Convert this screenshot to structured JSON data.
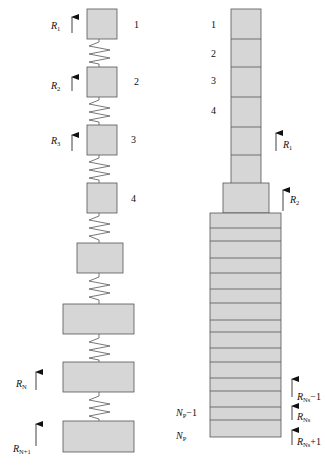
{
  "diagram": {
    "type": "mass-spring model comparison",
    "colors": {
      "box_fill": "#d6d6d6",
      "box_stroke": "#555555",
      "spring": "#555555",
      "arrow": "#111111"
    },
    "left_model": {
      "description": "Discrete masses connected by springs",
      "mass_labels": [
        "1",
        "2",
        "3",
        "4"
      ],
      "force_labels": [
        {
          "base": "R",
          "sub": "1"
        },
        {
          "base": "R",
          "sub": "2"
        },
        {
          "base": "R",
          "sub": "3"
        },
        {
          "base": "R",
          "sub": "N"
        },
        {
          "base": "R",
          "sub": "N+1"
        }
      ],
      "boxes": [
        {
          "x": 87,
          "y": 9,
          "w": 30,
          "h": 30
        },
        {
          "x": 87,
          "y": 67,
          "w": 30,
          "h": 30
        },
        {
          "x": 87,
          "y": 125,
          "w": 30,
          "h": 30
        },
        {
          "x": 87,
          "y": 183,
          "w": 30,
          "h": 30
        },
        {
          "x": 77,
          "y": 243,
          "w": 46,
          "h": 30
        },
        {
          "x": 63,
          "y": 304,
          "w": 71,
          "h": 30
        },
        {
          "x": 63,
          "y": 362,
          "w": 71,
          "h": 30
        },
        {
          "x": 63,
          "y": 421,
          "w": 71,
          "h": 31
        }
      ]
    },
    "right_model": {
      "description": "Stacked layered column",
      "layer_labels": [
        "1",
        "2",
        "3",
        "4"
      ],
      "bottom_labels": [
        {
          "base": "N",
          "sub": "P",
          "suffix": "−1"
        },
        {
          "base": "N",
          "sub": "P",
          "suffix": ""
        }
      ],
      "force_labels": [
        {
          "base": "R",
          "sub": "1",
          "suffix": ""
        },
        {
          "base": "R",
          "sub": "2",
          "suffix": ""
        },
        {
          "base": "R",
          "sub": "Ns",
          "suffix": "−1"
        },
        {
          "base": "R",
          "sub": "Ns",
          "suffix": ""
        },
        {
          "base": "R",
          "sub": "Ns",
          "suffix": "+1"
        }
      ]
    }
  }
}
